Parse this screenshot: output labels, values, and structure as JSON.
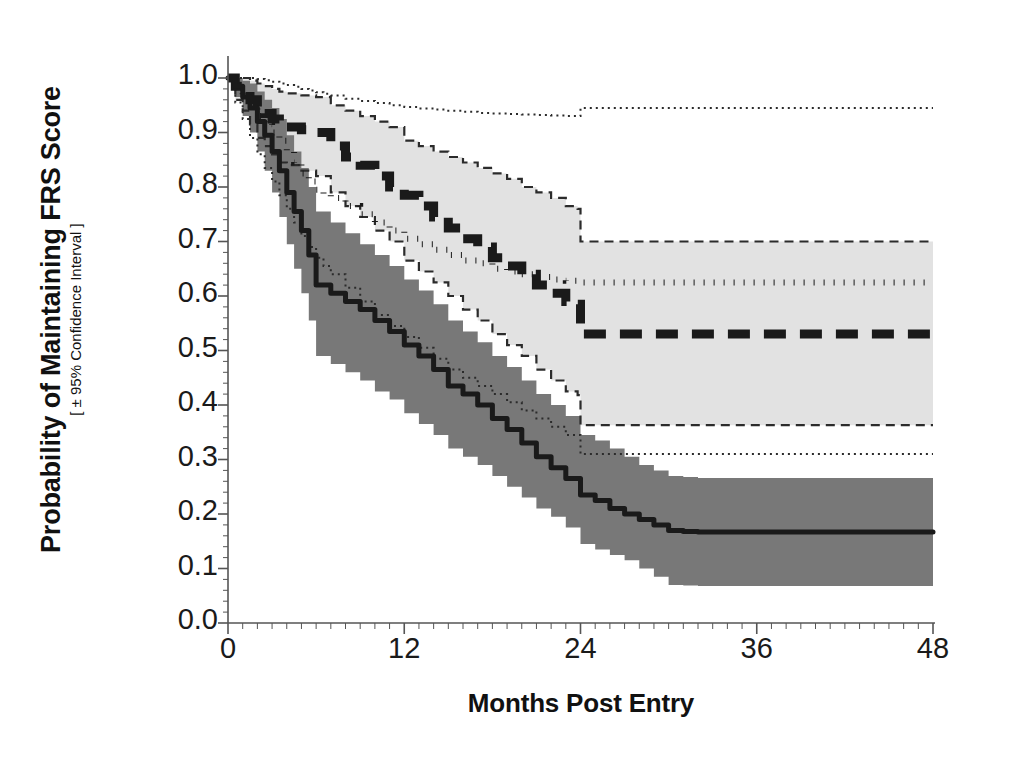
{
  "chart_data": {
    "type": "line",
    "title": "",
    "xlabel": "Months Post Entry",
    "ylabel": "Probability of Maintaining FRS Score",
    "ylabel_sub": "[ ± 95% Confidence Interval ]",
    "xlim": [
      0,
      48
    ],
    "ylim": [
      0.0,
      1.0
    ],
    "xticks": [
      0,
      12,
      24,
      36,
      48
    ],
    "xtick_labels": [
      "0",
      "12",
      "24",
      "36",
      "48"
    ],
    "yticks": [
      0.0,
      0.1,
      0.2,
      0.3,
      0.4,
      0.5,
      0.6,
      0.7,
      0.8,
      0.9,
      1.0
    ],
    "ytick_labels": [
      "0.0",
      "0.1",
      "0.2",
      "0.3",
      "0.4",
      "0.5",
      "0.6",
      "0.7",
      "0.8",
      "0.9",
      "1.0"
    ],
    "minor_xtick_interval": 1,
    "minor_ytick_interval": 0.02,
    "grid": false,
    "legend": "none",
    "colors": {
      "line": "#1a1a1a",
      "band_dark": "#787878",
      "band_light": "#e2e2e2",
      "axis": "#555555",
      "background": "#ffffff"
    },
    "series": [
      {
        "name": "solid-curve",
        "style": "solid",
        "linewidth": 5,
        "band_fill": "#787878",
        "band_style": "dotted-edge",
        "x": [
          0,
          0.5,
          1,
          1.5,
          2,
          2.5,
          3,
          3.5,
          4,
          4.5,
          5,
          5.5,
          6,
          7,
          8,
          9,
          10,
          11,
          12,
          13,
          14,
          15,
          16,
          17,
          18,
          19,
          20,
          21,
          22,
          23,
          24,
          25,
          26,
          27,
          28,
          29,
          30,
          31,
          32,
          34,
          36,
          40,
          44,
          48
        ],
        "y": [
          1.0,
          0.985,
          0.965,
          0.945,
          0.92,
          0.895,
          0.865,
          0.83,
          0.79,
          0.755,
          0.72,
          0.675,
          0.62,
          0.605,
          0.59,
          0.575,
          0.555,
          0.535,
          0.51,
          0.49,
          0.465,
          0.435,
          0.42,
          0.4,
          0.375,
          0.355,
          0.33,
          0.305,
          0.285,
          0.265,
          0.235,
          0.225,
          0.21,
          0.2,
          0.19,
          0.18,
          0.17,
          0.168,
          0.167,
          0.167,
          0.167,
          0.167,
          0.167,
          0.167
        ],
        "y_upper": [
          1.0,
          1.0,
          0.995,
          0.99,
          0.975,
          0.96,
          0.945,
          0.925,
          0.895,
          0.865,
          0.835,
          0.8,
          0.755,
          0.735,
          0.715,
          0.695,
          0.675,
          0.655,
          0.63,
          0.61,
          0.585,
          0.555,
          0.535,
          0.515,
          0.49,
          0.47,
          0.445,
          0.42,
          0.4,
          0.38,
          0.345,
          0.335,
          0.32,
          0.305,
          0.29,
          0.28,
          0.27,
          0.268,
          0.266,
          0.266,
          0.266,
          0.266,
          0.266,
          0.266
        ],
        "y_lower": [
          1.0,
          0.965,
          0.93,
          0.9,
          0.865,
          0.83,
          0.79,
          0.745,
          0.695,
          0.65,
          0.605,
          0.555,
          0.49,
          0.475,
          0.46,
          0.445,
          0.425,
          0.41,
          0.385,
          0.365,
          0.345,
          0.32,
          0.305,
          0.29,
          0.27,
          0.25,
          0.23,
          0.21,
          0.195,
          0.175,
          0.145,
          0.135,
          0.125,
          0.115,
          0.1,
          0.085,
          0.07,
          0.069,
          0.068,
          0.068,
          0.068,
          0.068,
          0.068,
          0.068
        ]
      },
      {
        "name": "dashed-curve",
        "style": "dashed",
        "linewidth": 9,
        "band_fill": "#e2e2e2",
        "band_style": "dashed-edge",
        "x": [
          0,
          0.5,
          1,
          1.5,
          2,
          2.5,
          3,
          3.5,
          4,
          5,
          6,
          7,
          8,
          9,
          10,
          11,
          12,
          13,
          14,
          15,
          16,
          17,
          18,
          19,
          20,
          21,
          22,
          23,
          23.8,
          24,
          30,
          36,
          42,
          48
        ],
        "y": [
          1.0,
          0.985,
          0.975,
          0.96,
          0.945,
          0.935,
          0.925,
          0.915,
          0.91,
          0.905,
          0.9,
          0.875,
          0.855,
          0.84,
          0.82,
          0.8,
          0.785,
          0.765,
          0.745,
          0.725,
          0.705,
          0.69,
          0.67,
          0.655,
          0.64,
          0.62,
          0.605,
          0.59,
          0.585,
          0.53,
          0.53,
          0.53,
          0.53,
          0.53
        ],
        "y_upper": [
          1.0,
          1.0,
          1.0,
          0.995,
          0.99,
          0.985,
          0.98,
          0.975,
          0.972,
          0.968,
          0.965,
          0.95,
          0.94,
          0.93,
          0.92,
          0.91,
          0.885,
          0.875,
          0.865,
          0.855,
          0.845,
          0.835,
          0.825,
          0.815,
          0.8,
          0.79,
          0.78,
          0.765,
          0.76,
          0.7,
          0.7,
          0.7,
          0.7,
          0.7
        ],
        "y_lower": [
          1.0,
          0.96,
          0.94,
          0.915,
          0.89,
          0.875,
          0.86,
          0.845,
          0.84,
          0.83,
          0.82,
          0.79,
          0.765,
          0.745,
          0.72,
          0.7,
          0.665,
          0.645,
          0.625,
          0.6,
          0.575,
          0.555,
          0.53,
          0.51,
          0.49,
          0.465,
          0.445,
          0.425,
          0.418,
          0.363,
          0.363,
          0.363,
          0.363,
          0.363
        ]
      },
      {
        "name": "dotted-curve",
        "style": "dotted",
        "linewidth": 6,
        "band_style": "dotted-outer",
        "x": [
          0,
          0.5,
          1,
          1.5,
          2,
          2.5,
          3,
          3.5,
          4,
          4.5,
          5,
          5.5,
          6,
          6.5,
          7,
          8,
          9,
          10,
          11,
          12,
          13,
          14,
          15,
          16,
          17,
          18,
          19,
          20,
          21,
          22,
          23,
          24,
          30,
          36,
          42,
          48
        ],
        "y": [
          1.0,
          0.985,
          0.965,
          0.95,
          0.93,
          0.915,
          0.9,
          0.885,
          0.865,
          0.845,
          0.825,
          0.81,
          0.795,
          0.785,
          0.78,
          0.765,
          0.75,
          0.735,
          0.72,
          0.705,
          0.695,
          0.685,
          0.675,
          0.665,
          0.66,
          0.65,
          0.645,
          0.64,
          0.635,
          0.63,
          0.628,
          0.625,
          0.625,
          0.625,
          0.625,
          0.625
        ],
        "y_upper": [
          1.0,
          1.0,
          1.0,
          1.0,
          0.998,
          0.996,
          0.993,
          0.99,
          0.987,
          0.984,
          0.98,
          0.977,
          0.974,
          0.971,
          0.968,
          0.962,
          0.958,
          0.954,
          0.95,
          0.947,
          0.944,
          0.942,
          0.94,
          0.938,
          0.936,
          0.935,
          0.934,
          0.933,
          0.932,
          0.931,
          0.93,
          0.945,
          0.945,
          0.945,
          0.945,
          0.945
        ],
        "y_lower": [
          1.0,
          0.955,
          0.925,
          0.89,
          0.86,
          0.835,
          0.81,
          0.785,
          0.76,
          0.735,
          0.71,
          0.69,
          0.67,
          0.655,
          0.64,
          0.615,
          0.59,
          0.565,
          0.545,
          0.525,
          0.505,
          0.485,
          0.465,
          0.45,
          0.435,
          0.42,
          0.405,
          0.39,
          0.375,
          0.36,
          0.345,
          0.31,
          0.31,
          0.31,
          0.31,
          0.31
        ]
      }
    ]
  }
}
